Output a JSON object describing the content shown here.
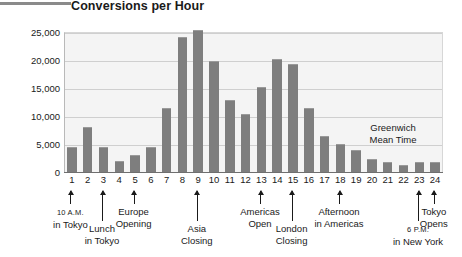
{
  "chart_data": {
    "type": "bar",
    "title": "Conversions per Hour",
    "xlabel": "",
    "ylabel": "",
    "ylim": [
      0,
      25000
    ],
    "yticks": [
      0,
      5000,
      10000,
      15000,
      20000,
      25000
    ],
    "ytick_labels": [
      "0",
      "5,000",
      "10,000",
      "15,000",
      "20,000",
      "25,000"
    ],
    "grid": true,
    "legend": false,
    "categories": [
      "1",
      "2",
      "3",
      "4",
      "5",
      "6",
      "7",
      "8",
      "9",
      "10",
      "11",
      "12",
      "13",
      "14",
      "15",
      "16",
      "17",
      "18",
      "19",
      "20",
      "21",
      "22",
      "23",
      "24"
    ],
    "values": [
      4500,
      8000,
      4500,
      2000,
      3000,
      4400,
      11500,
      24100,
      25300,
      19800,
      12800,
      10300,
      15200,
      20100,
      19300,
      11500,
      6400,
      5000,
      4000,
      2400,
      1700,
      1300,
      1700,
      1700
    ],
    "annotations": [
      {
        "category": "1",
        "lines": [
          "10 A.M.",
          "in Tokyo"
        ]
      },
      {
        "category": "3",
        "lines": [
          "Lunch",
          "in Tokyo"
        ]
      },
      {
        "category": "5",
        "lines": [
          "Europe",
          "Opening"
        ]
      },
      {
        "category": "9",
        "lines": [
          "Asia",
          "Closing"
        ]
      },
      {
        "category": "13",
        "lines": [
          "Americas",
          "Open"
        ]
      },
      {
        "category": "15",
        "lines": [
          "London",
          "Closing"
        ]
      },
      {
        "category": "18",
        "lines": [
          "Afternoon",
          "in Americas"
        ]
      },
      {
        "category": "23",
        "lines": [
          "6 P.M.",
          "in New York"
        ]
      },
      {
        "category": "24",
        "lines": [
          "Tokyo",
          "Opens"
        ]
      }
    ],
    "plot_note": [
      "Greenwich",
      "Mean Time"
    ]
  },
  "colors": {
    "bar": "#7e7e7e",
    "plot_background": "#f4f4f4",
    "gridline": "#cfcfcf",
    "axis": "#6f6f6f",
    "text": "#1a1a1a",
    "rule": "#8a8a8a"
  },
  "annotation_text": {
    "a1_l1": "10 A.M.",
    "a1_l2": "in Tokyo",
    "a3_l1": "Lunch",
    "a3_l2": "in Tokyo",
    "a5_l1": "Europe",
    "a5_l2": "Opening",
    "a9_l1": "Asia",
    "a9_l2": "Closing",
    "a13_l1": "Americas",
    "a13_l2": "Open",
    "a15_l1": "London",
    "a15_l2": "Closing",
    "a18_l1": "Afternoon",
    "a18_l2": "in Americas",
    "a23_l1": "6 P.M.",
    "a23_l2": "in New York",
    "a24_l1": "Tokyo",
    "a24_l2": "Opens",
    "note_l1": "Greenwich",
    "note_l2": "Mean Time"
  }
}
